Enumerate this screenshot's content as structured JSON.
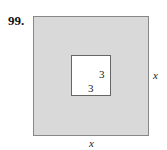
{
  "problem_number": "99.",
  "labels": {
    "inner_right": "3",
    "inner_bottom": "3",
    "outer_right": "x",
    "outer_bottom": "x"
  },
  "colors": {
    "outer_fill": "#d9d9d9",
    "inner_fill": "#ffffff"
  }
}
